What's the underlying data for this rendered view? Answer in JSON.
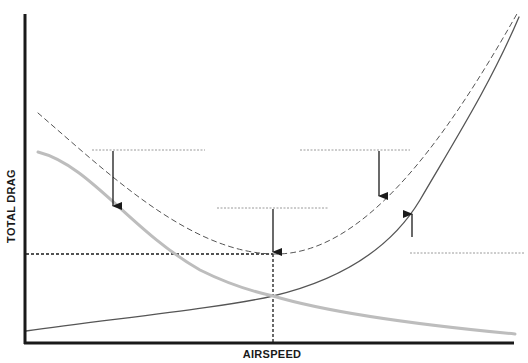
{
  "chart_data": {
    "type": "line",
    "title": "",
    "xlabel": "AIRSPEED",
    "ylabel": "TOTAL DRAG",
    "grid": false,
    "legend": null,
    "axes": {
      "origin": [
        25,
        343
      ],
      "x_end": 514,
      "y_top": 14,
      "color": "#1a1a1a",
      "width": 3
    },
    "series": [
      {
        "name": "total-drag",
        "style": "dashed",
        "color": "#555555",
        "width": 1,
        "path": "M38,113 C110,175 190,252 273,254 C360,256 440,150 518,12"
      },
      {
        "name": "parasite-drag",
        "style": "solid",
        "color": "#555555",
        "width": 1.3,
        "path": "M26,331 C120,318 220,308 273,296 C340,280 390,250 420,200 C455,140 490,85 519,17"
      },
      {
        "name": "induced-drag",
        "style": "solid",
        "color": "#bdbdbd",
        "width": 3,
        "path": "M38,152 C90,165 130,230 200,270 C230,285 255,292 273,296 C330,313 420,325 515,334"
      }
    ],
    "reference_lines": [
      {
        "name": "min-drag-horizontal",
        "x1": 26,
        "y1": 254,
        "x2": 273,
        "y2": 254,
        "dash": "3,2",
        "color": "#1a1a1a",
        "width": 1.3
      },
      {
        "name": "min-drag-vertical",
        "x1": 273,
        "y1": 254,
        "x2": 273,
        "y2": 343,
        "dash": "3,2",
        "color": "#1a1a1a",
        "width": 1.3
      }
    ],
    "level_lines": [
      {
        "name": "level-line-left",
        "x1": 92,
        "y1": 150,
        "x2": 205,
        "y2": 150
      },
      {
        "name": "level-line-center",
        "x1": 217,
        "y1": 208,
        "x2": 328,
        "y2": 208
      },
      {
        "name": "level-line-right-top",
        "x1": 300,
        "y1": 150,
        "x2": 410,
        "y2": 150
      },
      {
        "name": "level-line-right-bottom",
        "x1": 410,
        "y1": 253,
        "x2": 525,
        "y2": 253
      }
    ],
    "arrows": [
      {
        "name": "arrow-down-left",
        "x": 113,
        "y_from": 151,
        "y_to": 206
      },
      {
        "name": "arrow-down-center",
        "x": 273,
        "y_from": 209,
        "y_to": 252
      },
      {
        "name": "arrow-down-right",
        "x": 379,
        "y_from": 151,
        "y_to": 196
      },
      {
        "name": "arrow-up-right",
        "x": 412,
        "y_from": 237,
        "y_to": 214
      }
    ],
    "annotations": [
      {
        "type": "minimum-total-drag",
        "x": 273,
        "y": 254
      },
      {
        "type": "intersection-parasite-induced",
        "x": 273,
        "y": 296
      }
    ]
  },
  "labels": {
    "x_axis": "AIRSPEED",
    "y_axis": "TOTAL DRAG"
  }
}
